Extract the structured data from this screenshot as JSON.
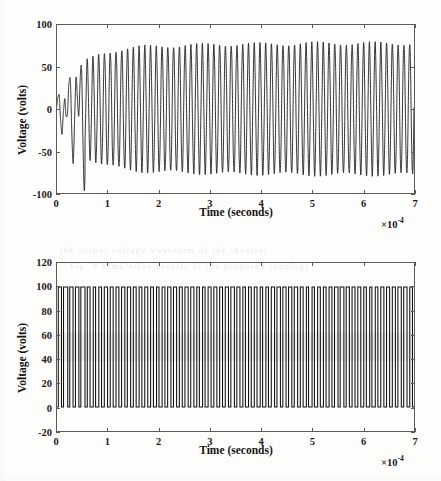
{
  "figure": {
    "background_color": "#fdfdfc",
    "axis_color": "#5a5a5a",
    "trace_color": "#101010",
    "scan_artifact_text": [
      "the output voltage waveform of the inverter",
      "Fig. 8  Simulation results of the proposed topology"
    ]
  },
  "charts": [
    {
      "id": "top",
      "name": "inverter-output-voltage-chart",
      "xlabel": "Time (seconds)",
      "ylabel": "Voltage (volts)",
      "x_exponent_prefix": "×",
      "x_exponent_base": "10",
      "x_exponent_power": "-4",
      "xticks": [
        "0",
        "1",
        "2",
        "3",
        "4",
        "5",
        "6",
        "7"
      ],
      "yticks": [
        "100",
        "50",
        "0",
        "-50",
        "-100"
      ]
    },
    {
      "id": "bottom",
      "name": "pwm-voltage-chart",
      "xlabel": "Time (seconds)",
      "ylabel": "Voltage (volts)",
      "x_exponent_prefix": "×",
      "x_exponent_base": "10",
      "x_exponent_power": "-4",
      "xticks": [
        "0",
        "1",
        "2",
        "3",
        "4",
        "5",
        "6",
        "7"
      ],
      "yticks": [
        "120",
        "100",
        "80",
        "60",
        "40",
        "20",
        "0",
        "-20"
      ]
    }
  ],
  "chart_data": [
    {
      "type": "line",
      "id": "top",
      "title": "",
      "xlabel": "Time (seconds)",
      "ylabel": "Voltage (volts)",
      "x_scale_exponent": -4,
      "x_tick_values": [
        0,
        1,
        2,
        3,
        4,
        5,
        6,
        7
      ],
      "y_tick_values": [
        -100,
        -50,
        0,
        50,
        100
      ],
      "xlim": [
        0,
        7
      ],
      "ylim": [
        -100,
        100
      ],
      "grid": false,
      "legend": "none",
      "description": "Growing sinusoidal inverter output voltage that starts near zero with small chaotic ringing and builds to a steady-state amplitude of about +/-78 V. Roughly 62 oscillation cycles are visible across the 0 to 7e-4 second window (approximately 88 kHz carrier-modulated 50 Hz-like ripple envelope).",
      "series": [
        {
          "name": "Output voltage",
          "color": "#101010",
          "carrier_cycles": 62,
          "envelope_points": [
            {
              "x": 0.0,
              "amp": 6
            },
            {
              "x": 0.08,
              "amp": 18
            },
            {
              "x": 0.16,
              "amp": 30
            },
            {
              "x": 0.24,
              "amp": 25
            },
            {
              "x": 0.32,
              "amp": 38
            },
            {
              "x": 0.45,
              "amp": 50
            },
            {
              "x": 0.6,
              "amp": 58
            },
            {
              "x": 0.8,
              "amp": 64
            },
            {
              "x": 1.0,
              "amp": 68
            },
            {
              "x": 1.3,
              "amp": 71
            },
            {
              "x": 1.7,
              "amp": 74
            },
            {
              "x": 2.2,
              "amp": 75
            },
            {
              "x": 2.8,
              "amp": 76
            },
            {
              "x": 3.4,
              "amp": 77
            },
            {
              "x": 4.2,
              "amp": 77
            },
            {
              "x": 5.0,
              "amp": 78
            },
            {
              "x": 6.0,
              "amp": 78
            },
            {
              "x": 7.0,
              "amp": 78
            }
          ],
          "steady_state_peak": 78,
          "steady_state_trough": -78
        }
      ]
    },
    {
      "type": "line",
      "id": "bottom",
      "title": "",
      "xlabel": "Time (seconds)",
      "ylabel": "Voltage (volts)",
      "x_scale_exponent": -4,
      "x_tick_values": [
        0,
        1,
        2,
        3,
        4,
        5,
        6,
        7
      ],
      "y_tick_values": [
        -20,
        0,
        20,
        40,
        60,
        80,
        100,
        120
      ],
      "xlim": [
        0,
        7
      ],
      "ylim": [
        -20,
        120
      ],
      "grid": false,
      "legend": "none",
      "description": "PWM switched voltage waveform toggling between 0 V and 100 V. Duty cycle varies sinusoidally, producing a dense band of vertical transitions; the visual mean density concentrates around 40 to 60 V. Approximately 62 switching pulses span the 0 to 7e-4 second window.",
      "series": [
        {
          "name": "PWM voltage",
          "color": "#101010",
          "low_level": 0,
          "high_level": 100,
          "pulse_count": 62,
          "duty_profile": [
            {
              "x": 0.0,
              "duty": 0.52
            },
            {
              "x": 0.3,
              "duty": 0.62
            },
            {
              "x": 0.6,
              "duty": 0.48
            },
            {
              "x": 0.9,
              "duty": 0.58
            },
            {
              "x": 1.3,
              "duty": 0.45
            },
            {
              "x": 1.8,
              "duty": 0.55
            },
            {
              "x": 2.4,
              "duty": 0.47
            },
            {
              "x": 3.0,
              "duty": 0.56
            },
            {
              "x": 3.6,
              "duty": 0.46
            },
            {
              "x": 4.2,
              "duty": 0.55
            },
            {
              "x": 4.9,
              "duty": 0.47
            },
            {
              "x": 5.6,
              "duty": 0.54
            },
            {
              "x": 6.3,
              "duty": 0.48
            },
            {
              "x": 7.0,
              "duty": 0.53
            }
          ]
        }
      ]
    }
  ]
}
